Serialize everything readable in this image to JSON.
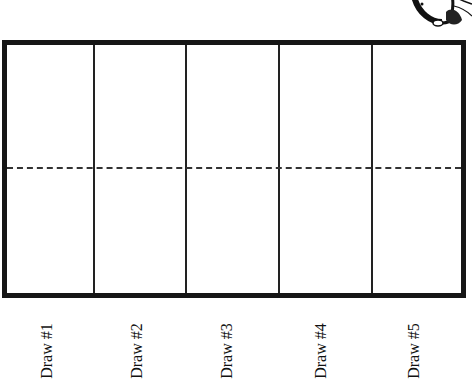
{
  "worksheet": {
    "columns": [
      {
        "label": "Draw #1"
      },
      {
        "label": "Draw #2"
      },
      {
        "label": "Draw #3"
      },
      {
        "label": "Draw #4"
      },
      {
        "label": "Draw #5"
      }
    ],
    "border_color": "#161616",
    "dashed_midline": true
  },
  "decoration": {
    "icon": "cartoon-character-icon"
  }
}
